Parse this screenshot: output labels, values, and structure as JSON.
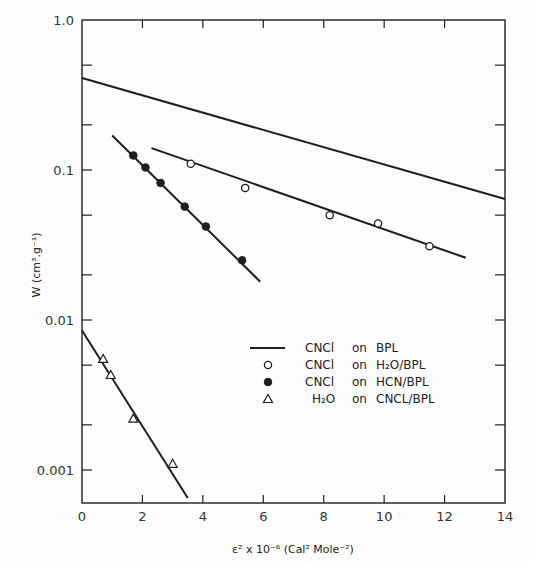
{
  "chart_data": {
    "type": "scatter",
    "title": "",
    "xlabel": "ε² x 10⁻⁶ (Cal² Mole⁻²)",
    "ylabel": "W (cm³.g⁻¹)",
    "xlim": [
      0,
      14
    ],
    "ylim": [
      0.0006,
      1.0
    ],
    "yscale": "log",
    "grid": false,
    "legend_position": "lower right (inside)",
    "x_ticks": [
      0,
      2,
      4,
      6,
      8,
      10,
      12,
      14
    ],
    "x_tick_labels": [
      "0",
      "2",
      "4",
      "6",
      "8",
      "10",
      "12",
      "14"
    ],
    "y_ticks": [
      1.0,
      0.1,
      0.01,
      0.001
    ],
    "y_tick_labels": [
      "1.0",
      "0.1",
      "0.01",
      "0.001"
    ],
    "series": [
      {
        "name": "CNCl on BPL",
        "marker": "line",
        "line": [
          [
            0,
            0.41
          ],
          [
            14,
            0.064
          ]
        ],
        "points": []
      },
      {
        "name": "CNCl on H2O/BPL",
        "marker": "open-circle",
        "line": [
          [
            2.3,
            0.14
          ],
          [
            12.7,
            0.026
          ]
        ],
        "points": [
          [
            3.6,
            0.11
          ],
          [
            5.4,
            0.076
          ],
          [
            8.2,
            0.05
          ],
          [
            9.8,
            0.044
          ],
          [
            11.5,
            0.031
          ]
        ]
      },
      {
        "name": "CNCl on HCN/BPL",
        "marker": "filled-circle",
        "line": [
          [
            1.0,
            0.17
          ],
          [
            5.9,
            0.018
          ]
        ],
        "points": [
          [
            1.7,
            0.125
          ],
          [
            2.1,
            0.104
          ],
          [
            2.6,
            0.082
          ],
          [
            3.4,
            0.057
          ],
          [
            4.1,
            0.042
          ],
          [
            5.3,
            0.025
          ]
        ]
      },
      {
        "name": "H2O on CNCL/BPL",
        "marker": "open-triangle",
        "line": [
          [
            0,
            0.0085
          ],
          [
            3.5,
            0.00065
          ]
        ],
        "points": [
          [
            0.7,
            0.0055
          ],
          [
            0.95,
            0.0043
          ],
          [
            1.7,
            0.0022
          ],
          [
            3.0,
            0.0011
          ]
        ]
      }
    ]
  },
  "legend": {
    "items": [
      {
        "substance": "CNCl",
        "on": "on",
        "substrate": "BPL",
        "marker": "line"
      },
      {
        "substance": "CNCl",
        "on": "on",
        "substrate": "H₂O/BPL",
        "marker": "open-circle"
      },
      {
        "substance": "CNCl",
        "on": "on",
        "substrate": "HCN/BPL",
        "marker": "filled-circle"
      },
      {
        "substance": "H₂O",
        "on": "on",
        "substrate": "CNCL/BPL",
        "marker": "open-triangle"
      }
    ]
  },
  "axes": {
    "x_label": "ε² x 10⁻⁶ (Cal² Mole⁻²)",
    "y_label": "W (cm³.g⁻¹)"
  }
}
